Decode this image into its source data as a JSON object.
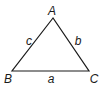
{
  "diagram": {
    "type": "triangle",
    "stroke_color": "#1a1a1a",
    "vertices": [
      {
        "id": "A",
        "label": "A",
        "x": 53,
        "y": 18,
        "label_x": 52,
        "label_y": 11
      },
      {
        "id": "B",
        "label": "B",
        "x": 12,
        "y": 71,
        "label_x": 8,
        "label_y": 79
      },
      {
        "id": "C",
        "label": "C",
        "x": 89,
        "y": 71,
        "label_x": 94,
        "label_y": 79
      }
    ],
    "sides": [
      {
        "id": "a",
        "label": "a",
        "from": "B",
        "to": "C",
        "label_x": 51,
        "label_y": 79
      },
      {
        "id": "b",
        "label": "b",
        "from": "A",
        "to": "C",
        "label_x": 78,
        "label_y": 41
      },
      {
        "id": "c",
        "label": "c",
        "from": "A",
        "to": "B",
        "label_x": 29,
        "label_y": 41
      }
    ]
  }
}
